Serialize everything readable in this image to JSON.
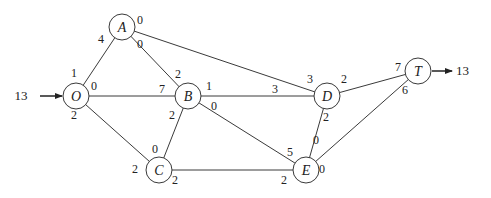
{
  "diagram": {
    "type": "network-flow",
    "node_radius": 13,
    "line_color": "#3a3a3a",
    "nodes": [
      {
        "id": "O",
        "label": "O",
        "x": 76,
        "y": 96
      },
      {
        "id": "A",
        "label": "A",
        "x": 122,
        "y": 27
      },
      {
        "id": "B",
        "label": "B",
        "x": 188,
        "y": 96
      },
      {
        "id": "C",
        "label": "C",
        "x": 159,
        "y": 170
      },
      {
        "id": "D",
        "label": "D",
        "x": 327,
        "y": 96
      },
      {
        "id": "E",
        "label": "E",
        "x": 306,
        "y": 170
      },
      {
        "id": "T",
        "label": "T",
        "x": 418,
        "y": 71
      }
    ],
    "edges": [
      {
        "from": "O",
        "to": "A"
      },
      {
        "from": "O",
        "to": "B"
      },
      {
        "from": "O",
        "to": "C"
      },
      {
        "from": "A",
        "to": "B"
      },
      {
        "from": "A",
        "to": "D"
      },
      {
        "from": "B",
        "to": "C"
      },
      {
        "from": "B",
        "to": "D"
      },
      {
        "from": "B",
        "to": "E"
      },
      {
        "from": "C",
        "to": "E"
      },
      {
        "from": "D",
        "to": "E"
      },
      {
        "from": "D",
        "to": "T"
      },
      {
        "from": "E",
        "to": "T"
      }
    ],
    "edge_labels": [
      {
        "text": "1",
        "x": 74,
        "y": 77
      },
      {
        "text": "0",
        "x": 94,
        "y": 90
      },
      {
        "text": "2",
        "x": 74,
        "y": 119
      },
      {
        "text": "4",
        "x": 101,
        "y": 43
      },
      {
        "text": "0",
        "x": 140,
        "y": 24
      },
      {
        "text": "0",
        "x": 140,
        "y": 48
      },
      {
        "text": "2",
        "x": 178,
        "y": 78
      },
      {
        "text": "7",
        "x": 162,
        "y": 93
      },
      {
        "text": "1",
        "x": 209,
        "y": 90
      },
      {
        "text": "2",
        "x": 172,
        "y": 119
      },
      {
        "text": "0",
        "x": 214,
        "y": 110
      },
      {
        "text": "0",
        "x": 155,
        "y": 153
      },
      {
        "text": "2",
        "x": 135,
        "y": 173
      },
      {
        "text": "2",
        "x": 175,
        "y": 184
      },
      {
        "text": "3",
        "x": 310,
        "y": 83
      },
      {
        "text": "3",
        "x": 275,
        "y": 93
      },
      {
        "text": "2",
        "x": 344,
        "y": 83
      },
      {
        "text": "2",
        "x": 326,
        "y": 121
      },
      {
        "text": "5",
        "x": 290,
        "y": 156
      },
      {
        "text": "0",
        "x": 316,
        "y": 144
      },
      {
        "text": "0",
        "x": 322,
        "y": 173
      },
      {
        "text": "2",
        "x": 284,
        "y": 184
      },
      {
        "text": "7",
        "x": 398,
        "y": 71
      },
      {
        "text": "6",
        "x": 405,
        "y": 94
      }
    ],
    "source": {
      "node": "O",
      "amount": "13",
      "label_x": 21,
      "label_y": 100,
      "arrow_from_x": 40,
      "arrow_to_x": 62,
      "arrow_y": 96
    },
    "sink": {
      "node": "T",
      "amount": "13",
      "label_x": 456,
      "label_y": 75,
      "arrow_from_x": 432,
      "arrow_to_x": 452,
      "arrow_y": 71
    }
  }
}
